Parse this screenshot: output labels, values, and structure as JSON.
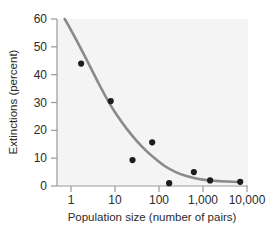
{
  "chart_data": {
    "type": "scatter",
    "title": "",
    "subtitle": "",
    "xlabel": "Population size (number of pairs)",
    "ylabel": "Extinctions (percent)",
    "xscale": "log",
    "yscale": "linear",
    "xlim": [
      0.55,
      22000
    ],
    "ylim": [
      0,
      60
    ],
    "grid": false,
    "legend": null,
    "xticks": [
      1,
      10,
      100,
      1000,
      10000
    ],
    "xtick_labels": [
      "1",
      "10",
      "100",
      "1,000",
      "10,000"
    ],
    "yticks": [
      0,
      10,
      20,
      30,
      40,
      50,
      60
    ],
    "ytick_labels": [
      "0",
      "10",
      "20",
      "30",
      "40",
      "50",
      "60"
    ],
    "series": [
      {
        "name": "Observed extinctions",
        "type": "scatter",
        "marker": "circle",
        "color": "#1c1c1c",
        "points": [
          {
            "x": 1.7,
            "y": 44.0
          },
          {
            "x": 8.0,
            "y": 30.5
          },
          {
            "x": 25.0,
            "y": 9.3
          },
          {
            "x": 70.0,
            "y": 15.7
          },
          {
            "x": 170.0,
            "y": 1.0
          },
          {
            "x": 620.0,
            "y": 5.0
          },
          {
            "x": 1450.0,
            "y": 2.0
          },
          {
            "x": 7000.0,
            "y": 1.5
          }
        ]
      },
      {
        "name": "Fitted decay curve",
        "type": "line",
        "color": "#8a8a8a",
        "points": [
          {
            "x": 0.72,
            "y": 60.0
          },
          {
            "x": 1.0,
            "y": 56.0
          },
          {
            "x": 1.6,
            "y": 50.0
          },
          {
            "x": 2.6,
            "y": 43.5
          },
          {
            "x": 4.2,
            "y": 37.0
          },
          {
            "x": 7.0,
            "y": 30.5
          },
          {
            "x": 11.0,
            "y": 25.5
          },
          {
            "x": 18.0,
            "y": 20.8
          },
          {
            "x": 30.0,
            "y": 16.5
          },
          {
            "x": 50.0,
            "y": 12.8
          },
          {
            "x": 85.0,
            "y": 9.6
          },
          {
            "x": 140.0,
            "y": 7.0
          },
          {
            "x": 240.0,
            "y": 5.0
          },
          {
            "x": 420.0,
            "y": 3.6
          },
          {
            "x": 750.0,
            "y": 2.6
          },
          {
            "x": 1400.0,
            "y": 2.0
          },
          {
            "x": 2600.0,
            "y": 1.7
          },
          {
            "x": 4600.0,
            "y": 1.5
          },
          {
            "x": 7000.0,
            "y": 1.45
          }
        ]
      }
    ],
    "colors": {
      "marker": "#1c1c1c",
      "curve": "#8a8a8a",
      "axis": "#9a9a9a",
      "text": "#2b2b2b",
      "plot_background": "#f4f4f4",
      "figure_background": "#ffffff"
    }
  }
}
